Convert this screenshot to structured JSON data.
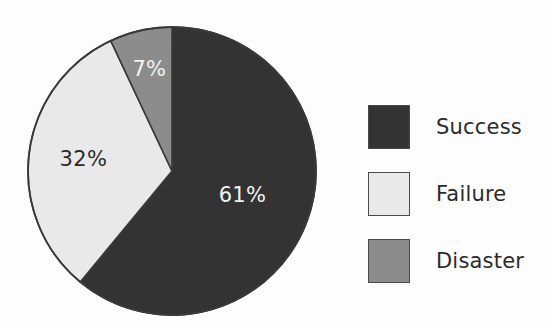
{
  "chart_data": {
    "type": "pie",
    "title": "",
    "categories": [
      "Success",
      "Failure",
      "Disaster"
    ],
    "values": [
      61,
      32,
      7
    ],
    "unit": "%",
    "data_labels": [
      "61%",
      "32%",
      "7%"
    ],
    "colors": [
      "#333333",
      "#e9e9e9",
      "#8c8c8c"
    ],
    "label_text_colors": [
      "#f2f2f2",
      "#2b2b2b",
      "#f2f2f2"
    ],
    "start_angle_deg": 0,
    "direction": "clockwise",
    "legend_position": "right",
    "grid": false,
    "outline_color": "#3a3a3a"
  },
  "chart": {
    "slices": [
      {
        "name": "Success",
        "label": "61%",
        "value": 61,
        "color": "#333333",
        "label_color": "#f2f2f2"
      },
      {
        "name": "Failure",
        "label": "32%",
        "value": 32,
        "color": "#e9e9e9",
        "label_color": "#2b2b2b"
      },
      {
        "name": "Disaster",
        "label": "7%",
        "value": 7,
        "color": "#8c8c8c",
        "label_color": "#f2f2f2"
      }
    ]
  },
  "legend": {
    "items": [
      {
        "label": "Success",
        "color": "#333333"
      },
      {
        "label": "Failure",
        "color": "#e9e9e9"
      },
      {
        "label": "Disaster",
        "color": "#8c8c8c"
      }
    ]
  }
}
